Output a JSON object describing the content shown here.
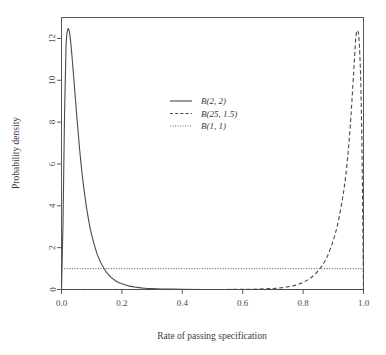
{
  "chart_data": {
    "type": "line",
    "title": "",
    "xlabel": "Rate of passing specification",
    "ylabel": "Probability density",
    "xlim": [
      0.0,
      1.0
    ],
    "ylim": [
      0,
      13.0
    ],
    "xticks": [
      "0.0",
      "0.2",
      "0.4",
      "0.6",
      "0.8",
      "1.0"
    ],
    "xtickvalues": [
      0.0,
      0.2,
      0.4,
      0.6,
      0.8,
      1.0
    ],
    "yticks": [
      "0",
      "2",
      "4",
      "6",
      "8",
      "10",
      "12"
    ],
    "ytickvalues": [
      0,
      2,
      4,
      6,
      8,
      10,
      12
    ],
    "grid": false,
    "legend_position": "upper center",
    "series": [
      {
        "name": "B(2, 2)",
        "linestyle": "solid",
        "color": "#4a4a4a",
        "x": [
          0.0,
          0.005,
          0.01,
          0.015,
          0.02,
          0.025,
          0.03,
          0.035,
          0.04,
          0.05,
          0.06,
          0.07,
          0.08,
          0.09,
          0.1,
          0.12,
          0.14,
          0.16,
          0.18,
          0.2,
          0.225,
          0.25,
          0.275,
          0.3,
          0.35,
          0.4,
          0.5,
          0.6,
          0.7,
          0.8,
          0.9,
          1.0
        ],
        "y": [
          0.0,
          3.2,
          8.3,
          11.6,
          12.38,
          12.4,
          11.9,
          11.1,
          10.2,
          8.4,
          6.7,
          5.3,
          4.2,
          3.3,
          2.6,
          1.62,
          1.02,
          0.64,
          0.41,
          0.27,
          0.16,
          0.1,
          0.06,
          0.04,
          0.02,
          0.01,
          0.0,
          0.0,
          0.0,
          0.0,
          0.0,
          0.0
        ]
      },
      {
        "name": "B(25, 1.5)",
        "linestyle": "dashed",
        "color": "#4a4a4a",
        "x": [
          0.0,
          0.1,
          0.2,
          0.3,
          0.4,
          0.5,
          0.6,
          0.65,
          0.7,
          0.725,
          0.75,
          0.775,
          0.8,
          0.82,
          0.84,
          0.86,
          0.88,
          0.9,
          0.915,
          0.93,
          0.94,
          0.95,
          0.958,
          0.965,
          0.97,
          0.975,
          0.98,
          0.985,
          0.99,
          0.993,
          0.996,
          0.999,
          1.0
        ],
        "y": [
          0.0,
          0.0,
          0.0,
          0.0,
          0.0,
          0.0,
          0.01,
          0.02,
          0.05,
          0.08,
          0.13,
          0.21,
          0.34,
          0.5,
          0.74,
          1.08,
          1.58,
          2.35,
          3.15,
          4.3,
          5.3,
          6.7,
          8.2,
          9.8,
          11.0,
          12.1,
          12.38,
          12.0,
          10.4,
          8.5,
          5.5,
          1.2,
          0.0
        ]
      },
      {
        "name": "B(1, 1)",
        "linestyle": "dotted",
        "color": "#6a6a6a",
        "x": [
          0.0,
          1.0
        ],
        "y": [
          1.0,
          1.0
        ]
      }
    ],
    "annotations": {
      "peak_left": {
        "x": 0.025,
        "y": 12.4
      },
      "peak_right": {
        "x": 0.978,
        "y": 12.35
      },
      "uniform_level": 1.0
    }
  },
  "legend": {
    "entries": [
      {
        "label": "B(2, 2)",
        "style": "solid"
      },
      {
        "label": "B(25, 1.5)",
        "style": "dashed"
      },
      {
        "label": "B(1, 1)",
        "style": "dotted"
      }
    ]
  }
}
